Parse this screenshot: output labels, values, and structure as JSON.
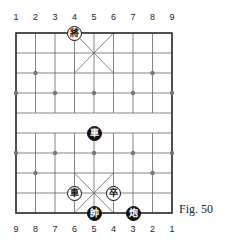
{
  "figure": {
    "caption": "Fig. 50"
  },
  "board": {
    "top_file_labels": [
      "1",
      "2",
      "3",
      "4",
      "5",
      "6",
      "7",
      "8",
      "9"
    ],
    "bottom_file_labels": [
      "9",
      "8",
      "7",
      "6",
      "5",
      "4",
      "3",
      "2",
      "1"
    ],
    "colors": {
      "line": "#555555",
      "border": "#333333",
      "dark_piece": "#111111",
      "light_piece": "#ffffff"
    }
  },
  "pieces": [
    {
      "char": "將",
      "side": "light",
      "col": 3,
      "row": 0,
      "name": "black-general"
    },
    {
      "char": "車",
      "side": "dark",
      "col": 4,
      "row": 5,
      "name": "red-chariot"
    },
    {
      "char": "車",
      "side": "light",
      "col": 3,
      "row": 8,
      "name": "black-chariot"
    },
    {
      "char": "卒",
      "side": "light",
      "col": 5,
      "row": 8,
      "name": "black-pawn"
    },
    {
      "char": "帥",
      "side": "dark",
      "col": 4,
      "row": 9,
      "name": "red-general"
    },
    {
      "char": "炮",
      "side": "dark",
      "col": 6,
      "row": 9,
      "name": "red-cannon"
    }
  ]
}
